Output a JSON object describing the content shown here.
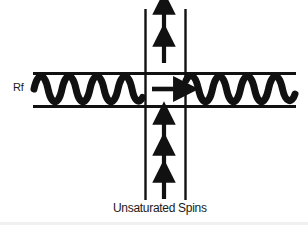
{
  "figure": {
    "background_color": "#ffffff",
    "ink_color": "#111111",
    "labels": {
      "rf": "Rf",
      "caption": "Unsaturated Spins"
    },
    "band": {
      "name": "rf-saturation-band",
      "x_start": 33,
      "x_end": 296,
      "top_line_y": 73,
      "bottom_line_y": 106,
      "line_thickness": 3
    },
    "slab": {
      "name": "unsaturated-spin-slab",
      "left_line_x": 145,
      "right_line_x": 185,
      "y_start": 9,
      "y_end": 200,
      "line_thickness": 2
    },
    "waveform": {
      "name": "rf-waveform",
      "center_y": 89,
      "amplitude": 12,
      "stroke_width": 7,
      "left_segment": {
        "x_start": 34,
        "x_end": 145,
        "cycles": 4.5
      },
      "right_segment": {
        "x_start": 185,
        "x_end": 295,
        "cycles": 4.5
      }
    },
    "arrows": {
      "horizontal": {
        "name": "rf-direction-arrow",
        "direction": "right",
        "x_start": 152,
        "x_end": 180,
        "y": 89
      },
      "vertical_top": {
        "direction": "up",
        "count": 2,
        "x": 164,
        "positions_y": [
          20,
          52
        ]
      },
      "vertical_bottom": {
        "direction": "up",
        "count": 3,
        "x": 164,
        "positions_y": [
          130,
          162,
          188
        ]
      }
    }
  }
}
